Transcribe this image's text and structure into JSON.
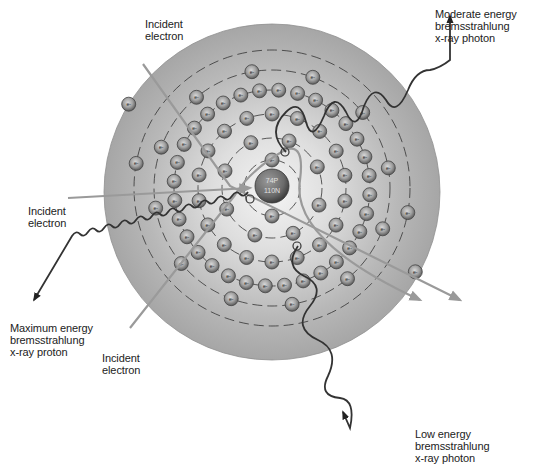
{
  "diagram": {
    "nucleus": {
      "protons": "74P",
      "neutrons": "110N"
    },
    "electron_symbol": "e-",
    "labels": {
      "incident_top": "Incident\nelectron",
      "incident_left": "Incident\nelectron",
      "incident_bottom": "Incident\nelectron",
      "moderate": "Moderate energy\nbremsstrahlung\nx-ray photon",
      "maximum": "Maximum energy\nbremsstrahlung\nx-ray proton",
      "low": "Low energy\nbremsstrahlung\nx-ray photon"
    },
    "colors": {
      "disk": "#a9a9a9",
      "disk_center": "#f2f2f2",
      "electron": "#8a8a8a",
      "nucleus": "#6e6e6e",
      "path": "#9a9a9a",
      "photon": "#333333"
    }
  }
}
